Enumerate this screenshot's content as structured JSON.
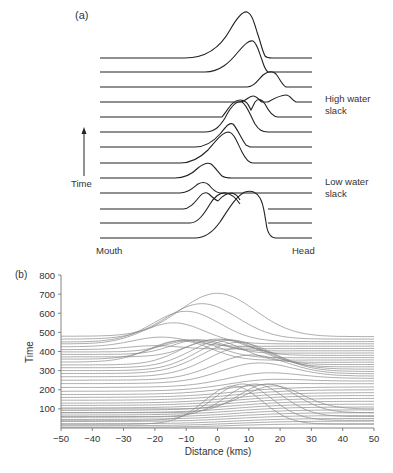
{
  "panel_a": {
    "label": "(a)",
    "time_label": "Time",
    "mouth_label": "Mouth",
    "head_label": "Head",
    "annotations": [
      {
        "text_lines": [
          "High water",
          "slack"
        ]
      },
      {
        "text_lines": [
          "Low water",
          "slack"
        ]
      }
    ],
    "line_color": "#222222"
  },
  "panel_b": {
    "label": "(b)",
    "line_color": "#8a8a8a",
    "axis_color": "#777777"
  },
  "chart_data": [
    {
      "type": "line",
      "title": "(a) Schematic along-estuary profiles through a tidal cycle (stacked, time increasing upward)",
      "xlabel": "",
      "ylabel": "Time",
      "x_endpoints": [
        "Mouth",
        "Head"
      ],
      "annotations": [
        "High water slack",
        "Low water slack"
      ],
      "n_profiles": 13,
      "grid": false,
      "legend": null
    },
    {
      "type": "line",
      "title": "(b)",
      "xlabel": "Distance (kms)",
      "ylabel": "Time",
      "xlim": [
        -50,
        50
      ],
      "ylim": [
        0,
        800
      ],
      "xticks": [
        -50,
        -40,
        -30,
        -20,
        -10,
        0,
        10,
        20,
        30,
        40,
        50
      ],
      "yticks": [
        100,
        200,
        300,
        400,
        500,
        600,
        700,
        800
      ],
      "grid": false,
      "legend": null,
      "series_model": "y(x) = L + (R-L)/(1+exp(-(x-c)/s)) + A*exp(-((x-m)/w)^2)",
      "series": [
        {
          "L": 480,
          "R": 478,
          "A": 225,
          "m": 0,
          "w": 17
        },
        {
          "L": 465,
          "R": 465,
          "A": 185,
          "m": -5,
          "w": 16
        },
        {
          "L": 450,
          "R": 452,
          "A": 160,
          "m": -10,
          "w": 15
        },
        {
          "L": 440,
          "R": 440,
          "A": 110,
          "m": -14,
          "w": 14
        },
        {
          "L": 425,
          "R": 428,
          "A": 50,
          "m": -18,
          "w": 13
        },
        {
          "L": 410,
          "R": 416,
          "A": 20,
          "m": -20,
          "w": 12
        },
        {
          "L": 398,
          "R": 404,
          "A": 60,
          "m": -8,
          "w": 12
        },
        {
          "L": 385,
          "R": 392,
          "A": 75,
          "m": -6,
          "w": 12
        },
        {
          "L": 372,
          "R": 380,
          "A": 90,
          "m": 0,
          "w": 13
        },
        {
          "L": 360,
          "R": 368,
          "A": 100,
          "m": -10,
          "w": 14
        },
        {
          "L": 345,
          "R": 356,
          "A": 110,
          "m": -12,
          "w": 14
        },
        {
          "L": 330,
          "R": 344,
          "A": 125,
          "m": -2,
          "w": 14
        },
        {
          "L": 315,
          "R": 332,
          "A": 140,
          "m": 2,
          "w": 15
        },
        {
          "L": 300,
          "R": 320,
          "A": 150,
          "m": 4,
          "w": 15
        },
        {
          "L": 285,
          "R": 308,
          "A": 150,
          "m": 6,
          "w": 16
        },
        {
          "L": 268,
          "R": 296,
          "A": 140,
          "m": 8,
          "w": 16
        },
        {
          "L": 250,
          "R": 284,
          "A": 110,
          "m": 10,
          "w": 16
        },
        {
          "L": 232,
          "R": 272,
          "A": 80,
          "m": 12,
          "w": 16
        },
        {
          "L": 212,
          "R": 260,
          "A": 40,
          "m": 14,
          "w": 16
        },
        {
          "L": 192,
          "R": 246,
          "A": 20,
          "m": 14,
          "w": 16
        },
        {
          "L": 175,
          "R": 232,
          "A": 10,
          "m": 14,
          "w": 16
        },
        {
          "L": 160,
          "R": 215,
          "A": 0,
          "m": 0,
          "w": 16
        },
        {
          "L": 145,
          "R": 200,
          "A": 0,
          "m": 0,
          "w": 16
        },
        {
          "L": 130,
          "R": 185,
          "A": 0,
          "m": 0,
          "w": 16
        },
        {
          "L": 118,
          "R": 170,
          "A": 0,
          "m": 0,
          "w": 16
        },
        {
          "L": 105,
          "R": 155,
          "A": 0,
          "m": 0,
          "w": 16
        },
        {
          "L": 92,
          "R": 140,
          "A": 0,
          "m": 0,
          "w": 16
        },
        {
          "L": 80,
          "R": 125,
          "A": 0,
          "m": 0,
          "w": 16
        },
        {
          "L": 68,
          "R": 110,
          "A": 0,
          "m": 0,
          "w": 16
        },
        {
          "L": 56,
          "R": 95,
          "A": 0,
          "m": 0,
          "w": 16
        },
        {
          "L": 45,
          "R": 80,
          "A": 0,
          "m": 0,
          "w": 16
        },
        {
          "L": 34,
          "R": 65,
          "A": 0,
          "m": 0,
          "w": 16
        },
        {
          "L": 22,
          "R": 50,
          "A": 0,
          "m": 0,
          "w": 16
        },
        {
          "L": 12,
          "R": 36,
          "A": 0,
          "m": 0,
          "w": 16
        },
        {
          "L": 4,
          "R": 22,
          "A": 0,
          "m": 0,
          "w": 16
        }
      ],
      "lower_group_bumps": [
        {
          "base": 20,
          "A": 200,
          "m": 5,
          "w": 13
        },
        {
          "base": 40,
          "A": 190,
          "m": 8,
          "w": 13
        },
        {
          "base": 60,
          "A": 170,
          "m": 12,
          "w": 13
        },
        {
          "base": 80,
          "A": 150,
          "m": 16,
          "w": 13
        },
        {
          "base": 100,
          "A": 120,
          "m": 18,
          "w": 13
        }
      ]
    }
  ]
}
